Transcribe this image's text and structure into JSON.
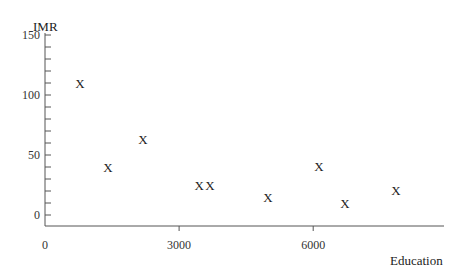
{
  "chart_data": {
    "type": "scatter",
    "title": "",
    "xlabel": "Education",
    "ylabel": "IMR",
    "marker": "X",
    "xlim": [
      0,
      8500
    ],
    "ylim": [
      -10,
      150
    ],
    "xticks": [
      0,
      3000,
      6000
    ],
    "xtick_labels": [
      "0",
      "3000",
      "6000"
    ],
    "yticks": [
      0,
      50,
      100,
      150
    ],
    "ytick_labels": [
      "0",
      "50",
      "100",
      "150"
    ],
    "y_minor_tick_step": 10,
    "grid": false,
    "legend": null,
    "points": [
      {
        "x": 780,
        "y": 110
      },
      {
        "x": 1410,
        "y": 40
      },
      {
        "x": 2190,
        "y": 63
      },
      {
        "x": 3450,
        "y": 25
      },
      {
        "x": 3690,
        "y": 25
      },
      {
        "x": 4990,
        "y": 15
      },
      {
        "x": 6130,
        "y": 41
      },
      {
        "x": 6710,
        "y": 10
      },
      {
        "x": 7850,
        "y": 21
      }
    ]
  },
  "colors": {
    "axis": "#555555",
    "text": "#222222",
    "background": "#ffffff"
  }
}
